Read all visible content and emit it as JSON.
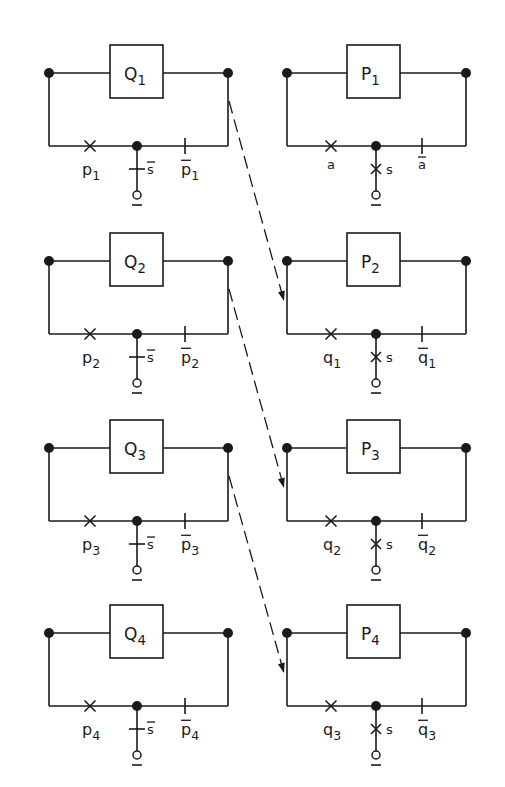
{
  "diagram": {
    "ink_color": "#1a1a1a",
    "left_column": [
      {
        "id": "Q1",
        "box_label": "Q",
        "box_sub": "1",
        "left_label": "p",
        "left_sub": "1",
        "stub_label": "s",
        "stub_label_overbar": true,
        "right_label": "p",
        "right_sub": "1",
        "right_overbar": true,
        "stub_contact": "normally-closed-tick"
      },
      {
        "id": "Q2",
        "box_label": "Q",
        "box_sub": "2",
        "left_label": "p",
        "left_sub": "2",
        "stub_label": "s",
        "stub_label_overbar": true,
        "right_label": "p",
        "right_sub": "2",
        "right_overbar": true,
        "stub_contact": "normally-closed-tick"
      },
      {
        "id": "Q3",
        "box_label": "Q",
        "box_sub": "3",
        "left_label": "p",
        "left_sub": "3",
        "stub_label": "s",
        "stub_label_overbar": true,
        "right_label": "p",
        "right_sub": "3",
        "right_overbar": true,
        "stub_contact": "normally-closed-tick"
      },
      {
        "id": "Q4",
        "box_label": "Q",
        "box_sub": "4",
        "left_label": "p",
        "left_sub": "4",
        "stub_label": "s",
        "stub_label_overbar": true,
        "right_label": "p",
        "right_sub": "4",
        "right_overbar": true,
        "stub_contact": "normally-closed-tick"
      }
    ],
    "right_column": [
      {
        "id": "P1",
        "box_label": "P",
        "box_sub": "1",
        "left_label": "a",
        "left_sub": "",
        "stub_label": "s",
        "stub_label_overbar": false,
        "right_label": "a",
        "right_sub": "",
        "right_overbar": true,
        "stub_contact": "cross"
      },
      {
        "id": "P2",
        "box_label": "P",
        "box_sub": "2",
        "left_label": "q",
        "left_sub": "1",
        "stub_label": "s",
        "stub_label_overbar": false,
        "right_label": "q",
        "right_sub": "1",
        "right_overbar": true,
        "stub_contact": "cross"
      },
      {
        "id": "P3",
        "box_label": "P",
        "box_sub": "3",
        "left_label": "q",
        "left_sub": "2",
        "stub_label": "s",
        "stub_label_overbar": false,
        "right_label": "q",
        "right_sub": "2",
        "right_overbar": true,
        "stub_contact": "cross"
      },
      {
        "id": "P4",
        "box_label": "P",
        "box_sub": "4",
        "left_label": "q",
        "left_sub": "3",
        "stub_label": "s",
        "stub_label_overbar": false,
        "right_label": "q",
        "right_sub": "3",
        "right_overbar": true,
        "stub_contact": "cross"
      }
    ],
    "arrows": [
      {
        "from": "Q1",
        "to": "P2",
        "style": "dashed"
      },
      {
        "from": "Q2",
        "to": "P3",
        "style": "dashed"
      },
      {
        "from": "Q3",
        "to": "P4",
        "style": "dashed"
      }
    ],
    "terminal_mark": "o-underlined"
  }
}
